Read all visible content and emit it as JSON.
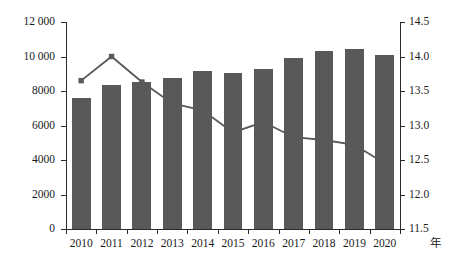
{
  "chart_data": {
    "type": "bar",
    "title": "",
    "subtitle": "",
    "xlabel": "年",
    "ylabel": "",
    "ylabel_right": "",
    "grid": false,
    "legend": "none",
    "categories": [
      "2010",
      "2011",
      "2012",
      "2013",
      "2014",
      "2015",
      "2016",
      "2017",
      "2018",
      "2019",
      "2020"
    ],
    "series": [
      {
        "name": "bars",
        "type": "bar",
        "axis": "left",
        "color": "#595959",
        "values": [
          7600,
          8350,
          8500,
          8750,
          9150,
          9050,
          9300,
          9900,
          10300,
          10450,
          10100
        ]
      },
      {
        "name": "line",
        "type": "line",
        "axis": "right",
        "color": "#595959",
        "marker": "square",
        "values": [
          13.65,
          14.0,
          13.63,
          13.32,
          13.22,
          12.9,
          13.05,
          12.83,
          12.79,
          12.72,
          12.45
        ]
      }
    ],
    "ylim": [
      0,
      12000
    ],
    "ylim_right": [
      11.5,
      14.5
    ],
    "yticks": [
      0,
      2000,
      4000,
      6000,
      8000,
      10000,
      12000
    ],
    "ytick_labels": [
      "0",
      "2000",
      "4000",
      "6000",
      "8000",
      "10 000",
      "12 000"
    ],
    "yticks_right": [
      11.5,
      12.0,
      12.5,
      13.0,
      13.5,
      14.0,
      14.5
    ],
    "ytick_labels_right": [
      "11.5",
      "12.0",
      "12.5",
      "13.0",
      "13.5",
      "14.0",
      "14.5"
    ]
  },
  "axes": {
    "left_labels": [
      "12 000",
      "10 000",
      "8000",
      "6000",
      "4000",
      "2000",
      "0"
    ],
    "right_labels": [
      "14.5",
      "14.0",
      "13.5",
      "13.0",
      "12.5",
      "12.0",
      "11.5"
    ],
    "x_labels": [
      "2010",
      "2011",
      "2012",
      "2013",
      "2014",
      "2015",
      "2016",
      "2017",
      "2018",
      "2019",
      "2020"
    ],
    "x_unit": "年"
  }
}
